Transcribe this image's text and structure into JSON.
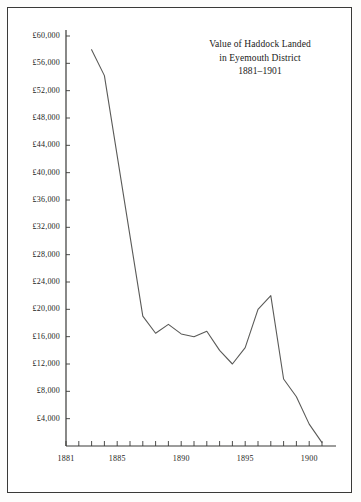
{
  "figure": {
    "title_lines": [
      "Value of Haddock Landed",
      "in Eyemouth District",
      "1881–1901"
    ],
    "border_color": "#3a3a38",
    "line_color": "#5a5a58",
    "axis_color": "#3a3a38",
    "background": "#ffffff"
  },
  "chart_data": {
    "type": "line",
    "title": "Value of Haddock Landed in Eyemouth District 1881–1901",
    "xlabel": "",
    "ylabel": "",
    "grid": false,
    "legend": null,
    "xlim": [
      1881,
      1901
    ],
    "ylim": [
      0,
      61000
    ],
    "ytick_labels": [
      "£60,000",
      "£56,000",
      "£52,000",
      "£48,000",
      "£44,000",
      "£40,000",
      "£36,000",
      "£32,000",
      "£28,000",
      "£24,000",
      "£20,000",
      "£16,000",
      "£12,000",
      "£8,000",
      "£4,000"
    ],
    "ytick_values": [
      60000,
      56000,
      52000,
      48000,
      44000,
      40000,
      36000,
      32000,
      28000,
      24000,
      20000,
      16000,
      12000,
      8000,
      4000
    ],
    "xtick_values": [
      1881,
      1882,
      1883,
      1884,
      1885,
      1886,
      1887,
      1888,
      1889,
      1890,
      1891,
      1892,
      1893,
      1894,
      1895,
      1896,
      1897,
      1898,
      1899,
      1900,
      1901
    ],
    "xtick_labels_shown": [
      {
        "value": 1881,
        "label": "1881"
      },
      {
        "value": 1885,
        "label": "1885"
      },
      {
        "value": 1890,
        "label": "1890"
      },
      {
        "value": 1895,
        "label": "1895"
      },
      {
        "value": 1900,
        "label": "1900"
      }
    ],
    "x": [
      1883,
      1884,
      1887,
      1888,
      1889,
      1890,
      1891,
      1892,
      1893,
      1894,
      1895,
      1896,
      1897,
      1898,
      1899,
      1900,
      1901
    ],
    "values": [
      58000,
      54200,
      19000,
      16500,
      17800,
      16400,
      16000,
      16800,
      14000,
      12000,
      14400,
      20000,
      22000,
      9800,
      7200,
      3200,
      500
    ],
    "series": [
      {
        "name": "Value of Haddock Landed",
        "x": [
          1883,
          1884,
          1887,
          1888,
          1889,
          1890,
          1891,
          1892,
          1893,
          1894,
          1895,
          1896,
          1897,
          1898,
          1899,
          1900,
          1901
        ],
        "values": [
          58000,
          54200,
          19000,
          16500,
          17800,
          16400,
          16000,
          16800,
          14000,
          12000,
          14400,
          20000,
          22000,
          9800,
          7200,
          3200,
          500
        ]
      }
    ]
  }
}
